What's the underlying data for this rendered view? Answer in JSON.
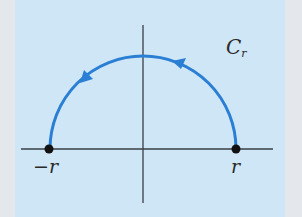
{
  "diagram": {
    "type": "contour",
    "colors": {
      "background": "#cfe6f6",
      "border": "#e4e8ec",
      "curve": "#2a7fd4",
      "axes": "#3a3f44",
      "points": "#111111"
    },
    "curve_label": {
      "main": "C",
      "subscript": "r"
    },
    "points": [
      {
        "label": "−r",
        "position": "left"
      },
      {
        "label": "r",
        "position": "right"
      }
    ],
    "arrows": [
      {
        "location": "upper-right of arc",
        "direction": "counterclockwise"
      },
      {
        "location": "upper-left of arc",
        "direction": "counterclockwise"
      }
    ]
  }
}
